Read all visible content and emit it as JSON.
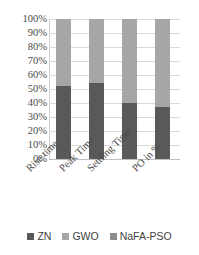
{
  "chart_data": {
    "type": "bar",
    "stacked": true,
    "normalized": "100%",
    "title": "",
    "subtitle": "",
    "xlabel": "",
    "ylabel": "",
    "ylim": [
      0,
      100
    ],
    "grid": true,
    "legend_position": "bottom",
    "categories": [
      "Rise time",
      "Peak Time",
      "Settling Time",
      "PO in %"
    ],
    "ytick_labels": [
      "100%",
      "90%",
      "80%",
      "70%",
      "60%",
      "50%",
      "40%",
      "30%",
      "20%",
      "10%",
      "0%"
    ],
    "ytick_values": [
      100,
      90,
      80,
      70,
      60,
      50,
      40,
      30,
      20,
      10,
      0
    ],
    "series": [
      {
        "name": "ZN",
        "color": "#595959",
        "values": [
          52,
          54,
          40,
          37
        ]
      },
      {
        "name": "GWO",
        "color": "#a6a6a6",
        "values": [
          48,
          46,
          60,
          63
        ]
      },
      {
        "name": "NaFA-PSO",
        "color": "#8c8c8c",
        "values": [
          0,
          0,
          0,
          0
        ]
      }
    ]
  },
  "legend": {
    "items": [
      {
        "label": "ZN",
        "color": "#595959"
      },
      {
        "label": "GWO",
        "color": "#a6a6a6"
      },
      {
        "label": "NaFA-PSO",
        "color": "#8c8c8c"
      }
    ]
  },
  "axis": {
    "grid_color": "#d9d9d9",
    "tick_text_color": "#4a4a4a"
  }
}
